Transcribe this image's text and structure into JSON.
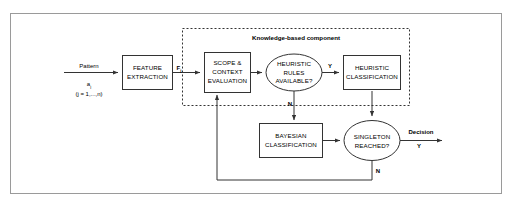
{
  "diagram": {
    "group": {
      "title": "Knowledge-based component"
    },
    "nodes": {
      "feature_extraction": {
        "line1": "FEATURE",
        "line2": "EXTRACTION"
      },
      "scope_context": {
        "line1": "SCOPE &",
        "line2": "CONTEXT",
        "line3": "EVALUATION"
      },
      "heuristic_rules": {
        "line1": "HEURISTIC",
        "line2": "RULES",
        "line3": "AVAILABLE?"
      },
      "heuristic_classification": {
        "line1": "HEURISTIC",
        "line2": "CLASSIFICATION"
      },
      "bayesian_classification": {
        "line1": "BAYESIAN",
        "line2": "CLASSIFICATION"
      },
      "singleton_reached": {
        "line1": "SINGLETON",
        "line2": "REACHED?"
      }
    },
    "labels": {
      "pattern": "Pattern",
      "pattern_symbol": "a",
      "pattern_symbol_sub": "j",
      "pattern_range": "(j = 1,...,n)",
      "feature_vector": "F",
      "feature_vector_sub": "j",
      "rules_yes": "Y",
      "rules_no": "N",
      "singleton_yes": "Y",
      "singleton_no": "N",
      "decision": "Decision"
    },
    "colors": {
      "stroke": "#333333",
      "frame": "#9a9a9a",
      "background": "#ffffff"
    }
  }
}
